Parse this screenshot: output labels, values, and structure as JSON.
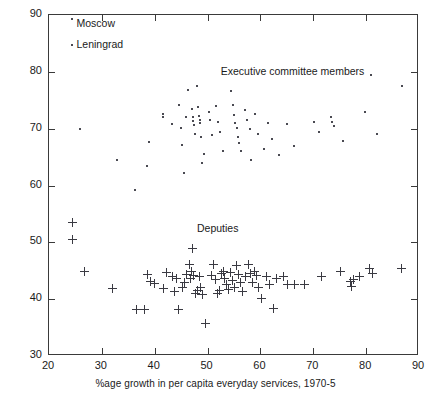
{
  "chart_data": {
    "type": "scatter",
    "title": "",
    "xlabel": "%age growth in per capita everyday services, 1970-5",
    "ylabel": "",
    "xlim": [
      20,
      90
    ],
    "ylim": [
      30,
      90
    ],
    "xticks": [
      20,
      30,
      40,
      50,
      60,
      70,
      80,
      90
    ],
    "yticks": [
      30,
      40,
      50,
      60,
      70,
      80,
      90
    ],
    "grid": false,
    "legend_position": "in-plot-annotations",
    "annotations": [
      {
        "text": "Executive committee members",
        "x": 52.5,
        "y": 80.2
      },
      {
        "text": "Deputies",
        "x": 48.0,
        "y": 52.6
      },
      {
        "text": "Moscow",
        "x": 25.2,
        "y": 88.6
      },
      {
        "text": "Leningrad",
        "x": 25.2,
        "y": 84.9
      }
    ],
    "series": [
      {
        "name": "Moscow",
        "marker": "dot",
        "points": [
          [
            24.3,
            89.3
          ]
        ]
      },
      {
        "name": "Leningrad",
        "marker": "dot",
        "points": [
          [
            24.3,
            84.7
          ]
        ]
      },
      {
        "name": "Executive committee members",
        "marker": "dot",
        "points": [
          [
            25.8,
            70.0
          ],
          [
            32.8,
            64.5
          ],
          [
            36.2,
            59.2
          ],
          [
            38.5,
            63.5
          ],
          [
            39.0,
            67.6
          ],
          [
            41.5,
            72.6
          ],
          [
            41.5,
            72.1
          ],
          [
            43.3,
            70.9
          ],
          [
            44.6,
            74.1
          ],
          [
            44.9,
            70.1
          ],
          [
            45.2,
            67.2
          ],
          [
            45.6,
            62.2
          ],
          [
            46.0,
            72.0
          ],
          [
            46.3,
            76.8
          ],
          [
            47.0,
            73.4
          ],
          [
            47.2,
            72.0
          ],
          [
            47.3,
            71.4
          ],
          [
            47.4,
            70.6
          ],
          [
            47.6,
            69.0
          ],
          [
            48.0,
            77.5
          ],
          [
            48.2,
            73.9
          ],
          [
            48.3,
            72.3
          ],
          [
            48.5,
            71.6
          ],
          [
            48.6,
            71.0
          ],
          [
            48.8,
            68.5
          ],
          [
            49.0,
            64.0
          ],
          [
            49.3,
            65.6
          ],
          [
            50.2,
            73.0
          ],
          [
            50.4,
            71.5
          ],
          [
            50.8,
            68.8
          ],
          [
            51.6,
            74.0
          ],
          [
            52.0,
            71.2
          ],
          [
            52.3,
            69.5
          ],
          [
            53.0,
            66.0
          ],
          [
            54.4,
            76.6
          ],
          [
            54.8,
            74.1
          ],
          [
            55.0,
            72.4
          ],
          [
            55.2,
            71.0
          ],
          [
            55.6,
            70.2
          ],
          [
            55.8,
            68.5
          ],
          [
            56.0,
            67.4
          ],
          [
            56.4,
            66.0
          ],
          [
            57.0,
            73.2
          ],
          [
            57.4,
            71.6
          ],
          [
            58.0,
            70.0
          ],
          [
            58.3,
            64.4
          ],
          [
            59.0,
            72.6
          ],
          [
            59.6,
            69.0
          ],
          [
            60.6,
            66.4
          ],
          [
            61.4,
            71.0
          ],
          [
            62.2,
            68.2
          ],
          [
            63.6,
            65.3
          ],
          [
            65.0,
            70.9
          ],
          [
            66.3,
            67.0
          ],
          [
            70.2,
            71.2
          ],
          [
            71.0,
            69.5
          ],
          [
            73.4,
            72.1
          ],
          [
            73.6,
            71.2
          ],
          [
            74.0,
            70.4
          ],
          [
            75.6,
            67.8
          ],
          [
            79.8,
            73.0
          ],
          [
            81.0,
            79.5
          ],
          [
            82.0,
            69.0
          ],
          [
            86.8,
            77.5
          ]
        ]
      },
      {
        "name": "Deputies",
        "marker": "plus",
        "points": [
          [
            24.4,
            53.6
          ],
          [
            24.4,
            50.5
          ],
          [
            26.6,
            45.0
          ],
          [
            32.0,
            42.0
          ],
          [
            36.4,
            38.2
          ],
          [
            38.0,
            38.2
          ],
          [
            38.6,
            44.4
          ],
          [
            39.2,
            43.2
          ],
          [
            39.8,
            42.8
          ],
          [
            41.6,
            42.0
          ],
          [
            42.2,
            44.7
          ],
          [
            43.2,
            44.0
          ],
          [
            43.6,
            41.4
          ],
          [
            44.0,
            43.8
          ],
          [
            44.4,
            38.2
          ],
          [
            45.2,
            42.2
          ],
          [
            45.6,
            43.0
          ],
          [
            46.0,
            44.4
          ],
          [
            46.4,
            46.2
          ],
          [
            46.6,
            43.8
          ],
          [
            46.8,
            45.0
          ],
          [
            47.0,
            49.0
          ],
          [
            47.2,
            44.2
          ],
          [
            47.6,
            41.0
          ],
          [
            48.0,
            41.6
          ],
          [
            48.4,
            44.0
          ],
          [
            48.6,
            42.2
          ],
          [
            49.0,
            40.9
          ],
          [
            49.6,
            35.8
          ],
          [
            50.6,
            44.2
          ],
          [
            51.0,
            46.2
          ],
          [
            51.4,
            43.6
          ],
          [
            51.8,
            41.0
          ],
          [
            52.2,
            41.6
          ],
          [
            52.6,
            44.6
          ],
          [
            53.0,
            45.0
          ],
          [
            53.2,
            43.8
          ],
          [
            53.4,
            42.6
          ],
          [
            53.8,
            41.8
          ],
          [
            54.2,
            44.8
          ],
          [
            54.6,
            43.4
          ],
          [
            55.0,
            42.2
          ],
          [
            55.4,
            46.0
          ],
          [
            55.8,
            44.5
          ],
          [
            56.2,
            43.0
          ],
          [
            56.6,
            41.4
          ],
          [
            57.0,
            44.0
          ],
          [
            57.6,
            46.2
          ],
          [
            58.0,
            44.6
          ],
          [
            58.4,
            43.0
          ],
          [
            58.8,
            45.0
          ],
          [
            59.2,
            44.2
          ],
          [
            59.6,
            42.2
          ],
          [
            60.2,
            40.2
          ],
          [
            61.0,
            44.0
          ],
          [
            61.6,
            42.6
          ],
          [
            62.4,
            38.4
          ],
          [
            63.0,
            43.8
          ],
          [
            64.2,
            44.0
          ],
          [
            65.0,
            42.6
          ],
          [
            66.4,
            42.6
          ],
          [
            68.2,
            42.6
          ],
          [
            71.4,
            44.0
          ],
          [
            75.0,
            45.0
          ],
          [
            77.0,
            43.2
          ],
          [
            77.2,
            42.4
          ],
          [
            77.6,
            43.6
          ],
          [
            78.6,
            44.0
          ],
          [
            80.6,
            45.4
          ],
          [
            81.2,
            44.6
          ],
          [
            86.6,
            45.4
          ]
        ]
      }
    ]
  }
}
